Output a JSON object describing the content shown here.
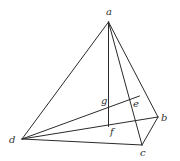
{
  "diagram": {
    "type": "tetrahedron",
    "points": {
      "a": {
        "x": 108.5,
        "y": 22,
        "label": "a",
        "lx": 106,
        "ly": 15
      },
      "b": {
        "x": 158,
        "y": 117,
        "label": "b",
        "lx": 161,
        "ly": 121
      },
      "c": {
        "x": 142,
        "y": 145,
        "label": "c",
        "lx": 140,
        "ly": 156
      },
      "d": {
        "x": 22,
        "y": 139,
        "label": "d",
        "lx": 9,
        "ly": 143
      },
      "e": {
        "x": 131,
        "y": 99,
        "label": "e",
        "lx": 133,
        "ly": 107
      },
      "f": {
        "x": 108.5,
        "y": 126.5,
        "label": "f",
        "lx": 110,
        "ly": 135
      },
      "g": {
        "x": 108.5,
        "y": 107,
        "label": "g",
        "lx": 101,
        "ly": 104
      }
    },
    "edges": [
      [
        "a",
        "d"
      ],
      [
        "a",
        "b"
      ],
      [
        "a",
        "c"
      ],
      [
        "d",
        "c"
      ],
      [
        "c",
        "b"
      ],
      [
        "d",
        "b"
      ],
      [
        "a",
        "f"
      ]
    ],
    "extra_segment": {
      "from": "d",
      "to": {
        "x": 139.5,
        "y": 96
      }
    },
    "stroke_color": "#2a2a2a",
    "label_color": "#333333"
  }
}
